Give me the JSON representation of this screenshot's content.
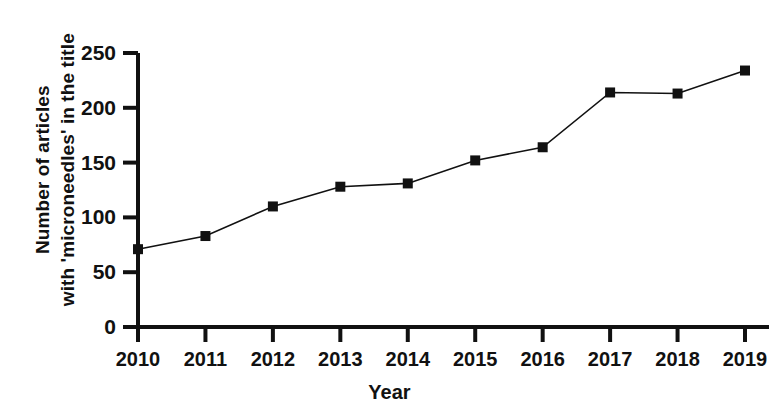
{
  "chart_data": {
    "type": "line",
    "title": "",
    "xlabel": "Year",
    "ylabel": "Number of articles with 'microneedles' in the title",
    "ylabel_lines": [
      "Number of articles",
      "with 'microneedles' in the title"
    ],
    "categories": [
      "2010",
      "2011",
      "2012",
      "2013",
      "2014",
      "2015",
      "2016",
      "2017",
      "2018",
      "2019"
    ],
    "values": [
      71,
      83,
      110,
      128,
      131,
      152,
      164,
      214,
      213,
      234
    ],
    "yticks": [
      0,
      50,
      100,
      150,
      200,
      250
    ],
    "ytick_labels": [
      "0",
      "50",
      "100",
      "150",
      "200",
      "250"
    ],
    "ylim": [
      0,
      250
    ],
    "xlim": [
      "2010",
      "2019"
    ],
    "grid": false,
    "legend": false,
    "marker": "filled-square",
    "line_color": "#111111",
    "marker_color": "#111111",
    "background_color": "#ffffff",
    "series": [
      {
        "name": "Number of articles with 'microneedles' in the title",
        "values": [
          71,
          83,
          110,
          128,
          131,
          152,
          164,
          214,
          213,
          234
        ]
      }
    ],
    "points": [
      {
        "x": "2010",
        "y": 71
      },
      {
        "x": "2011",
        "y": 83
      },
      {
        "x": "2012",
        "y": 110
      },
      {
        "x": "2013",
        "y": 128
      },
      {
        "x": "2014",
        "y": 131
      },
      {
        "x": "2015",
        "y": 152
      },
      {
        "x": "2016",
        "y": 164
      },
      {
        "x": "2017",
        "y": 214
      },
      {
        "x": "2018",
        "y": 213
      },
      {
        "x": "2019",
        "y": 234
      }
    ]
  }
}
